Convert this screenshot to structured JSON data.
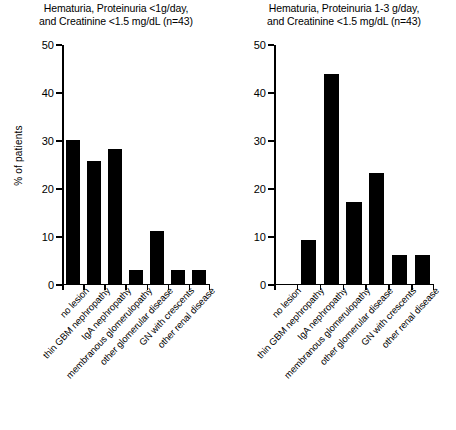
{
  "chart_data": {
    "type": "bar",
    "ylabel": "% of patients",
    "xlabel": "",
    "ylim": [
      0,
      50
    ],
    "yticks": [
      0,
      10,
      20,
      30,
      40,
      50
    ],
    "grid": false,
    "legend": false,
    "categories": [
      "no lesion",
      "thin GBM nephropathy",
      "IgA nephropathy",
      "membranous glomerulopathy",
      "other glomerular disease",
      "GN with crescents",
      "other renal disease"
    ],
    "panels": [
      {
        "title_line1": "Hematuria, Proteinuria <1g/day,",
        "title_line2": "and Creatinine <1.5 mg/dL (n=43)",
        "values": [
          30,
          25.5,
          28,
          2.8,
          11,
          2.8,
          2.8
        ]
      },
      {
        "title_line1": "Hematuria, Proteinuria 1-3 g/day,",
        "title_line2": "and Creatinine <1.5 mg/dL (n=43)",
        "values": [
          0,
          9,
          43.7,
          17,
          23,
          6,
          6
        ]
      }
    ],
    "bar_color": "#000000",
    "axis_color": "#000000"
  }
}
